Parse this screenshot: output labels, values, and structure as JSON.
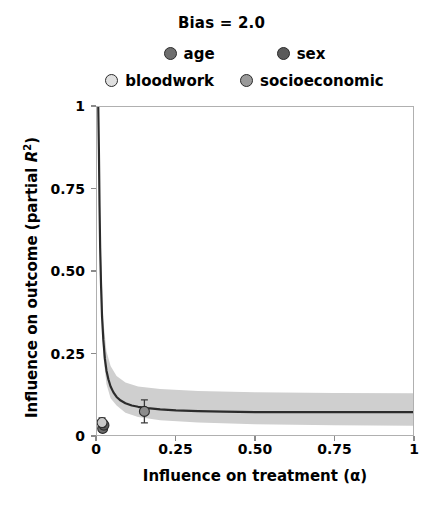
{
  "chart_data": {
    "type": "line",
    "title": "Bias = 2.0",
    "xlabel": "Influence on treatment (α)",
    "ylabel_parts": {
      "pre": "Influence on outcome (partial ",
      "italic": "R",
      "sup": "2",
      "post": ")"
    },
    "ylabel": "Influence on outcome (partial R2)",
    "xlim": [
      0,
      1
    ],
    "ylim": [
      0,
      1
    ],
    "xticks": [
      0,
      0.25,
      0.5,
      0.75,
      1
    ],
    "xticklabels": [
      "0",
      "0.25",
      "0.50",
      "0.75",
      "1"
    ],
    "yticks": [
      0,
      0.25,
      0.5,
      0.75,
      1
    ],
    "yticklabels": [
      "0",
      "0.25",
      "0.50",
      "0.75",
      "1"
    ],
    "grid": false,
    "legend_position": "above-axes",
    "series": [
      {
        "name": "bias-curve",
        "type": "line",
        "color": "#2b2b2b",
        "x": [
          0.004,
          0.006,
          0.008,
          0.01,
          0.013,
          0.016,
          0.02,
          0.025,
          0.03,
          0.036,
          0.043,
          0.052,
          0.062,
          0.075,
          0.09,
          0.11,
          0.13,
          0.16,
          0.2,
          0.25,
          0.32,
          0.4,
          0.5,
          0.62,
          0.75,
          0.88,
          1.0
        ],
        "y": [
          1.0,
          0.87,
          0.7,
          0.57,
          0.45,
          0.36,
          0.29,
          0.232,
          0.196,
          0.17,
          0.148,
          0.13,
          0.116,
          0.105,
          0.097,
          0.09,
          0.086,
          0.082,
          0.078,
          0.075,
          0.073,
          0.071,
          0.07,
          0.07,
          0.07,
          0.07,
          0.07
        ]
      },
      {
        "name": "confidence-band",
        "type": "area",
        "color": "#cfcfcf",
        "x": [
          0.004,
          0.01,
          0.02,
          0.03,
          0.043,
          0.062,
          0.09,
          0.13,
          0.2,
          0.32,
          0.5,
          0.75,
          1.0
        ],
        "y_upper": [
          1.0,
          0.62,
          0.35,
          0.255,
          0.21,
          0.18,
          0.16,
          0.148,
          0.14,
          0.134,
          0.13,
          0.128,
          0.127
        ],
        "y_lower": [
          1.0,
          0.52,
          0.24,
          0.155,
          0.112,
          0.09,
          0.068,
          0.055,
          0.045,
          0.038,
          0.033,
          0.03,
          0.028
        ]
      }
    ],
    "points": [
      {
        "label": "age",
        "x": 0.018,
        "y": 0.02,
        "color": "#6e6e6e",
        "yerr": 0.012
      },
      {
        "label": "sex",
        "x": 0.022,
        "y": 0.03,
        "color": "#5a5a5a",
        "yerr": 0.012
      },
      {
        "label": "bloodwork",
        "x": 0.016,
        "y": 0.038,
        "color": "#c9c9c9",
        "yerr": 0.014
      },
      {
        "label": "socioeconomic",
        "x": 0.15,
        "y": 0.072,
        "color": "#8c8c8c",
        "yerr": 0.035
      }
    ]
  },
  "legend": {
    "rows": [
      [
        {
          "label": "age",
          "color": "#6e6e6e"
        },
        {
          "label": "sex",
          "color": "#5a5a5a"
        }
      ],
      [
        {
          "label": "bloodwork",
          "color": "#e0e0e0"
        },
        {
          "label": "socioeconomic",
          "color": "#9a9a9a"
        }
      ]
    ]
  },
  "axes": {
    "xticklabels": [
      "0",
      "0.25",
      "0.50",
      "0.75",
      "1"
    ],
    "yticklabels": [
      "0",
      "0.25",
      "0.50",
      "0.75",
      "1"
    ]
  }
}
